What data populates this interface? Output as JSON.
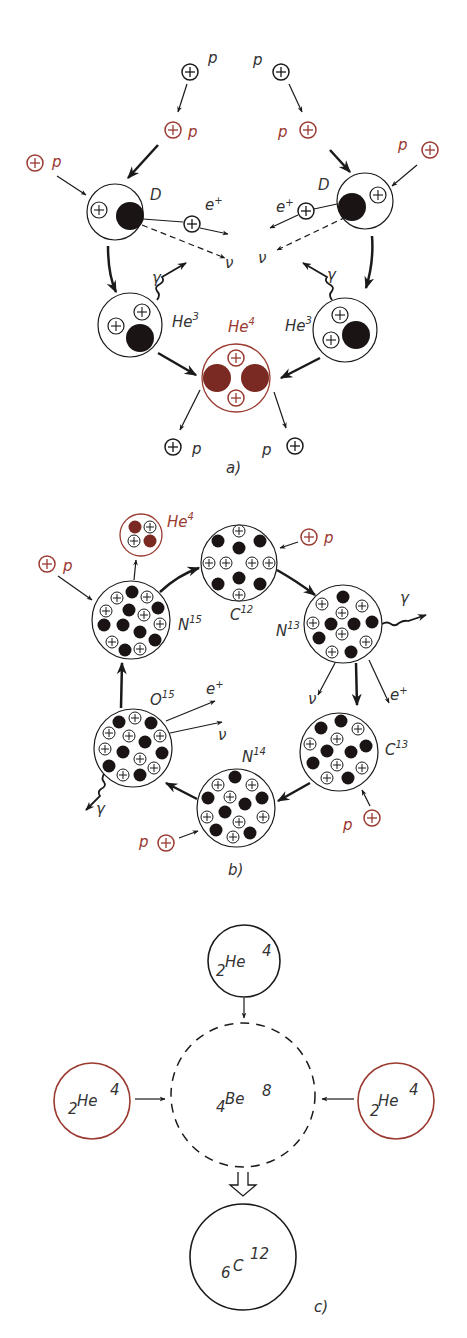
{
  "colors": {
    "ink": "#1a1a1a",
    "accent": "#9a3a30",
    "neutron": "#1a1414",
    "accent_fill": "#7a2a22"
  },
  "panel_a": {
    "caption": "a)",
    "labels": {
      "p": "p",
      "D": "D",
      "e_plus": "e",
      "plus": "+",
      "nu": "ν",
      "gamma": "γ",
      "He3": "He",
      "He3_sup": "3",
      "He4": "He",
      "He4_sup": "4"
    }
  },
  "panel_b": {
    "caption": "b)",
    "labels": {
      "p": "p",
      "He4": "He",
      "He4_sup": "4",
      "C12": "C",
      "C12_sup": "12",
      "N13": "N",
      "N13_sup": "13",
      "C13": "C",
      "C13_sup": "13",
      "N14": "N",
      "N14_sup": "14",
      "O15": "O",
      "O15_sup": "15",
      "N15": "N",
      "N15_sup": "15",
      "gamma": "γ",
      "nu": "ν",
      "e_plus": "e",
      "plus": "+"
    }
  },
  "panel_c": {
    "caption": "c)",
    "He4": {
      "sub": "2",
      "sym": "He",
      "sup": "4"
    },
    "Be8": {
      "sub": "4",
      "sym": "Be",
      "sup": "8"
    },
    "C12": {
      "sub": "6",
      "sym": "C",
      "sup": "12"
    }
  }
}
